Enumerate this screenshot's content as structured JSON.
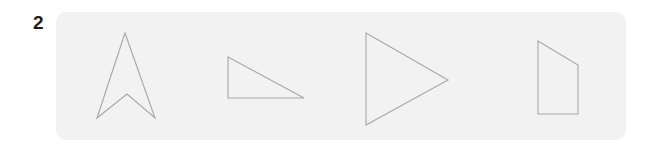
{
  "panel": {
    "label": "shape-row-panel",
    "background_color": "#f2f2f2",
    "corner_radius": 10,
    "x": 56,
    "y": 12,
    "width": 570,
    "height": 128
  },
  "item": {
    "number": "2"
  },
  "style": {
    "page_background": "#ffffff",
    "stroke_color": "#a8a8a8",
    "stroke_width": 1.15,
    "number_color": "#1c1c1c"
  },
  "chart_data": {
    "type": "diagram",
    "title": "",
    "subtitle": "",
    "xlabel": "",
    "ylabel": "",
    "grid": false,
    "legend": false,
    "shape_count": 4,
    "shapes": [
      {
        "name": "arrow-chevron",
        "kind": "concave-polygon",
        "vertex_count": 4,
        "points": "125,33 155,118 127,94 97,118",
        "bbox": {
          "x": 97,
          "y": 33,
          "width": 58,
          "height": 85
        }
      },
      {
        "name": "right-triangle",
        "kind": "polygon",
        "vertex_count": 3,
        "points": "228,57 304,98 228,98",
        "bbox": {
          "x": 228,
          "y": 57,
          "width": 76,
          "height": 41
        }
      },
      {
        "name": "triangle-pointing-right",
        "kind": "polygon",
        "vertex_count": 3,
        "points": "366,33 448,80 366,125",
        "bbox": {
          "x": 366,
          "y": 33,
          "width": 82,
          "height": 92
        }
      },
      {
        "name": "quadrilateral-trapezoid",
        "kind": "polygon",
        "vertex_count": 4,
        "points": "538,41 578,65 578,114 538,114",
        "bbox": {
          "x": 538,
          "y": 41,
          "width": 40,
          "height": 73
        }
      }
    ]
  }
}
